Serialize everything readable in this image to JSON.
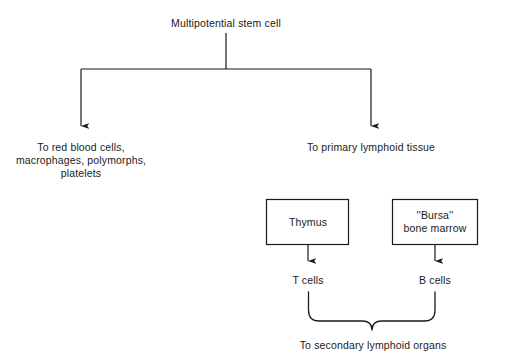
{
  "diagram": {
    "title_node": {
      "label": "Multipotential stem cell"
    },
    "branch_left": {
      "label_line1": "To red blood cells,",
      "label_line2": "macrophages, polymorphs,",
      "label_line3": "platelets"
    },
    "branch_right": {
      "label": "To primary lymphoid tissue"
    },
    "boxes": [
      {
        "name": "thymus",
        "label_line1": "Thymus",
        "label_line2": ""
      },
      {
        "name": "bursa",
        "label_line1": "''Bursa''",
        "label_line2": "bone marrow"
      }
    ],
    "outputs": [
      {
        "name": "t-cells",
        "label": "T cells"
      },
      {
        "name": "b-cells",
        "label": "B cells"
      }
    ],
    "footer": {
      "label": "To secondary lymphoid organs"
    },
    "colors": {
      "background": "#ffffff",
      "stroke": "#1a1a1a",
      "text": "#1a1a1a"
    }
  }
}
